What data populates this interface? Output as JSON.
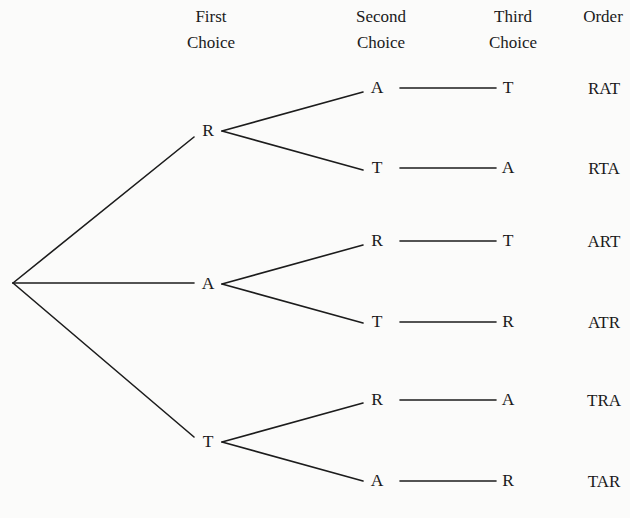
{
  "headers": {
    "first": {
      "line1": "First",
      "line2": "Choice"
    },
    "second": {
      "line1": "Second",
      "line2": "Choice"
    },
    "third": {
      "line1": "Third",
      "line2": "Choice"
    },
    "order": {
      "line1": "Order"
    }
  },
  "tree": {
    "first_level": [
      {
        "label": "R",
        "second_level": [
          {
            "label": "A",
            "third": "T",
            "order": "RAT"
          },
          {
            "label": "T",
            "third": "A",
            "order": "RTA"
          }
        ]
      },
      {
        "label": "A",
        "second_level": [
          {
            "label": "R",
            "third": "T",
            "order": "ART"
          },
          {
            "label": "T",
            "third": "R",
            "order": "ATR"
          }
        ]
      },
      {
        "label": "T",
        "second_level": [
          {
            "label": "R",
            "third": "A",
            "order": "TRA"
          },
          {
            "label": "A",
            "third": "R",
            "order": "TAR"
          }
        ]
      }
    ]
  },
  "outcomes": [
    "RAT",
    "RTA",
    "ART",
    "ATR",
    "TRA",
    "TAR"
  ]
}
